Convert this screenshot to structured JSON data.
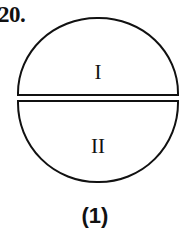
{
  "figure": {
    "question_number": "20.",
    "caption": "(1)",
    "shape": "circle-divided-into-two-half-discs",
    "stroke_color": "#111111",
    "fill_color": "#ffffff",
    "background_color": "#ffffff",
    "regions": [
      {
        "id": "upper",
        "label": "I",
        "shape": "upper-semicircle"
      },
      {
        "id": "lower",
        "label": "II",
        "shape": "lower-semicircle"
      }
    ]
  }
}
